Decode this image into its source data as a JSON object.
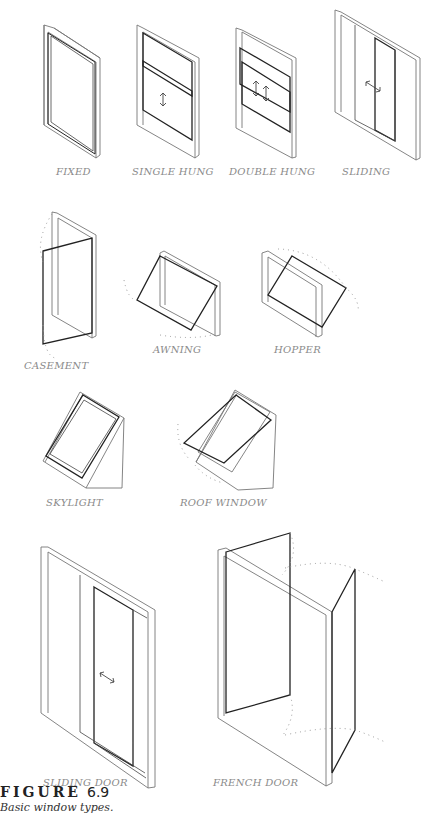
{
  "figure": {
    "items": [
      {
        "id": "fixed",
        "label": "FIXED"
      },
      {
        "id": "single-hung",
        "label": "SINGLE HUNG"
      },
      {
        "id": "double-hung",
        "label": "DOUBLE HUNG"
      },
      {
        "id": "sliding",
        "label": "SLIDING"
      },
      {
        "id": "casement",
        "label": "CASEMENT"
      },
      {
        "id": "awning",
        "label": "AWNING"
      },
      {
        "id": "hopper",
        "label": "HOPPER"
      },
      {
        "id": "skylight",
        "label": "SKYLIGHT"
      },
      {
        "id": "roof-window",
        "label": "ROOF WINDOW"
      },
      {
        "id": "sliding-door",
        "label": "SLIDING DOOR"
      },
      {
        "id": "french-door",
        "label": "FRENCH DOOR"
      }
    ],
    "caption": {
      "title": "FIGURE",
      "number": "6.9",
      "text": "Basic window types."
    }
  }
}
